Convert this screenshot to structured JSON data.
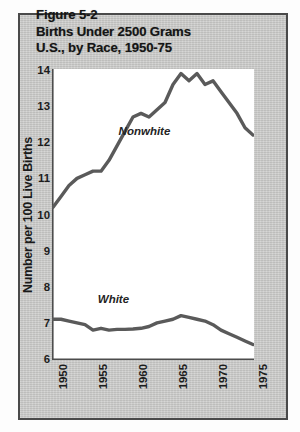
{
  "figure": {
    "title_lines": [
      "Figure 5-2",
      "Births Under 2500 Grams",
      "U.S., by Race, 1950-75"
    ],
    "title_line_1": "Figure 5-2",
    "title_line_2": "Births Under 2500 Grams",
    "title_line_3": "U.S., by Race, 1950-75",
    "panel_background": "#c9c9c7",
    "panel_border": "#4a4a4a",
    "plot_background": "#ffffff",
    "curve_color": "#5a5a5a"
  },
  "chart_data": {
    "type": "line",
    "title": "Figure 5-2 Births Under 2500 Grams U.S., by Race, 1950-75",
    "subtitle": "",
    "xlabel": "",
    "ylabel": "Number per 100 Live Births",
    "xlim": [
      1950,
      1975
    ],
    "ylim": [
      6,
      14
    ],
    "grid": false,
    "legend": "inline-annotations",
    "x_tick_labels": [
      "1950",
      "1955",
      "1960",
      "1965",
      "1970",
      "1975"
    ],
    "x_tick_values": [
      1950,
      1955,
      1960,
      1965,
      1970,
      1975
    ],
    "x_minor_ticks_every": 1,
    "y_tick_labels": [
      "6",
      "7",
      "8",
      "9",
      "10",
      "11",
      "12",
      "13",
      "14"
    ],
    "y_tick_values": [
      6,
      7,
      8,
      9,
      10,
      11,
      12,
      13,
      14
    ],
    "x": [
      1950,
      1951,
      1952,
      1953,
      1954,
      1955,
      1956,
      1957,
      1958,
      1959,
      1960,
      1961,
      1962,
      1963,
      1964,
      1965,
      1966,
      1967,
      1968,
      1969,
      1970,
      1971,
      1972,
      1973,
      1974,
      1975
    ],
    "series": [
      {
        "name": "Nonwhite",
        "color": "#5a5a5a",
        "annotation": "Nonwhite",
        "values": [
          10.2,
          10.5,
          10.8,
          11.0,
          11.1,
          11.2,
          11.2,
          11.5,
          11.9,
          12.3,
          12.7,
          12.8,
          12.7,
          12.9,
          13.1,
          13.6,
          13.9,
          13.7,
          13.9,
          13.6,
          13.7,
          13.4,
          13.1,
          12.8,
          12.4,
          12.2
        ]
      },
      {
        "name": "White",
        "color": "#5a5a5a",
        "annotation": "White",
        "values": [
          7.1,
          7.1,
          7.05,
          7.0,
          6.95,
          6.8,
          6.85,
          6.8,
          6.82,
          6.82,
          6.83,
          6.85,
          6.9,
          7.0,
          7.05,
          7.1,
          7.2,
          7.15,
          7.1,
          7.05,
          6.95,
          6.8,
          6.7,
          6.6,
          6.5,
          6.4
        ]
      }
    ],
    "annotations": [
      {
        "text": "Nonwhite",
        "x": 1958.2,
        "y": 12.2
      },
      {
        "text": "White",
        "x": 1955.6,
        "y": 7.55
      }
    ]
  }
}
